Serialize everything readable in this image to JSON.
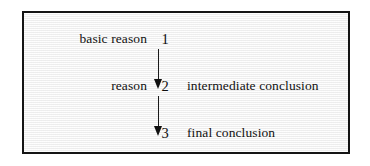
{
  "figure": {
    "background_color": "#f2f2f2",
    "border_color": "#141414",
    "text_color": "#111111",
    "arrow_color": "#1a1a1a",
    "rows": [
      {
        "left_label": "basic reason",
        "number": "1",
        "right_label": ""
      },
      {
        "left_label": "reason",
        "number": "2",
        "right_label": "intermediate conclusion"
      },
      {
        "left_label": "",
        "number": "3",
        "right_label": "final conclusion"
      }
    ],
    "arrows": [
      {
        "from": "1",
        "to": "2",
        "direction": "down"
      },
      {
        "from": "2",
        "to": "3",
        "direction": "down"
      }
    ]
  }
}
